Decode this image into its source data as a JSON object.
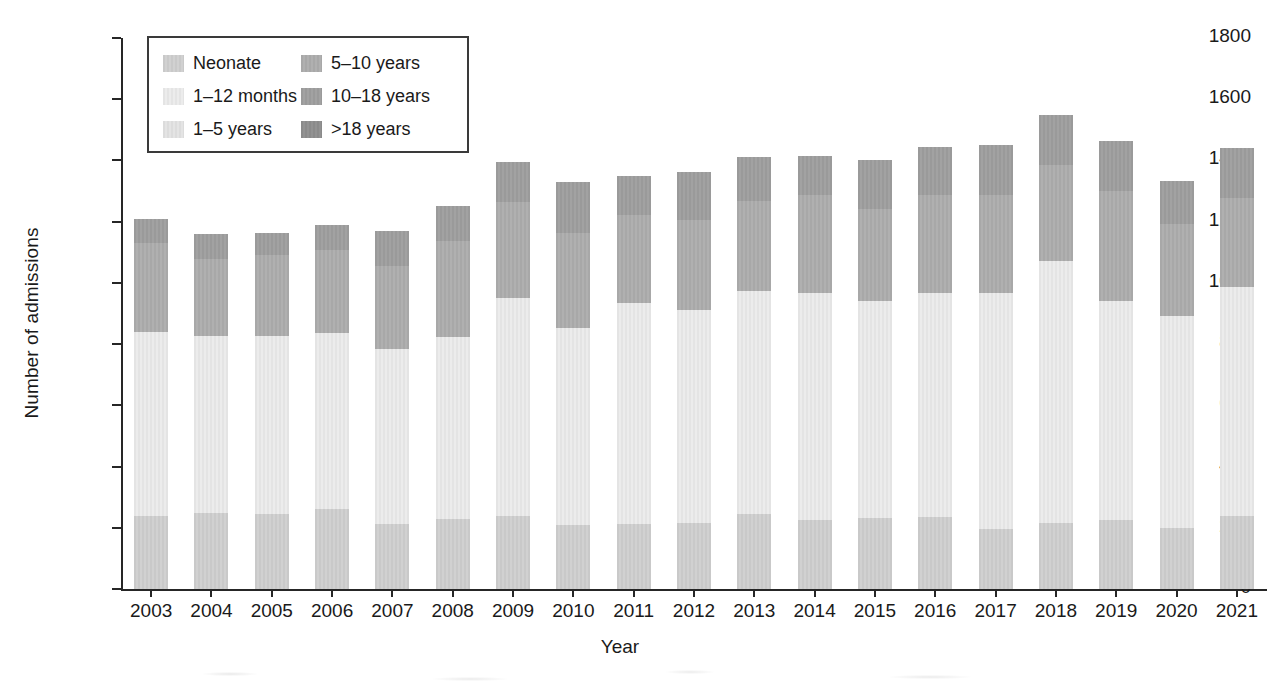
{
  "chart_data": {
    "type": "bar",
    "stacked": true,
    "title": "",
    "xlabel": "Year",
    "ylabel": "Number of admissions",
    "ylim": [
      0,
      1800
    ],
    "ytick_step": 200,
    "yticks": [
      0,
      200,
      400,
      600,
      800,
      1000,
      1200,
      1400,
      1600,
      1800
    ],
    "grid": false,
    "legend_position": "upper-left-inside",
    "categories": [
      "2003",
      "2004",
      "2005",
      "2006",
      "2007",
      "2008",
      "2009",
      "2010",
      "2011",
      "2012",
      "2013",
      "2014",
      "2015",
      "2016",
      "2017",
      "2018",
      "2019",
      "2020",
      "2021"
    ],
    "series": [
      {
        "name": "Neonate",
        "color": "#c9c9c9",
        "values": [
          238,
          248,
          246,
          262,
          214,
          228,
          238,
          210,
          214,
          216,
          246,
          224,
          232,
          234,
          196,
          216,
          224,
          200,
          240
        ]
      },
      {
        "name": "1–12 months",
        "color": "#e4e4e4",
        "values": [
          602,
          578,
          580,
          574,
          570,
          596,
          714,
          644,
          720,
          696,
          726,
          742,
          710,
          734,
          772,
          856,
          718,
          692,
          748
        ]
      },
      {
        "name": "1–5 years",
        "color": "#dcdcdc",
        "values": [
          0,
          0,
          0,
          0,
          0,
          0,
          0,
          0,
          0,
          0,
          0,
          0,
          0,
          0,
          0,
          0,
          0,
          0,
          0
        ]
      },
      {
        "name": "5–10 years",
        "color": "#a8a8a8",
        "values": [
          290,
          252,
          264,
          272,
          272,
          312,
          312,
          310,
          288,
          294,
          296,
          320,
          300,
          318,
          320,
          312,
          358,
          300,
          288
        ]
      },
      {
        "name": "10–18 years",
        "color": "#9a9a9a",
        "values": [
          78,
          82,
          74,
          82,
          114,
          114,
          132,
          166,
          128,
          156,
          142,
          128,
          158,
          158,
          162,
          166,
          162,
          142,
          164
        ]
      },
      {
        "name": ">18 years",
        "color": "#8a8a8a",
        "values": [
          0,
          0,
          0,
          0,
          0,
          0,
          0,
          0,
          0,
          0,
          0,
          0,
          0,
          0,
          0,
          0,
          0,
          0,
          0
        ]
      }
    ],
    "totals": [
      1208,
      1160,
      1164,
      1190,
      1170,
      1250,
      1396,
      1330,
      1350,
      1362,
      1410,
      1414,
      1400,
      1444,
      1450,
      1550,
      1462,
      1334,
      1440
    ]
  },
  "legend": {
    "items": [
      {
        "label": "Neonate",
        "color": "#c9c9c9"
      },
      {
        "label": "1–12 months",
        "color": "#e4e4e4"
      },
      {
        "label": "1–5 years",
        "color": "#dcdcdc"
      },
      {
        "label": "5–10 years",
        "color": "#a8a8a8"
      },
      {
        "label": "10–18 years",
        "color": "#9a9a9a"
      },
      {
        "label": ">18 years",
        "color": "#8a8a8a"
      }
    ]
  }
}
